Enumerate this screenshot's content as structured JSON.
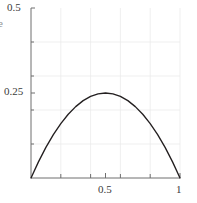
{
  "chart_data": {
    "type": "line",
    "title": "",
    "subtitle": "",
    "xlabel": "",
    "ylabel": "e",
    "xlim": [
      0,
      1
    ],
    "ylim": [
      0,
      0.5
    ],
    "grid": true,
    "legend": null,
    "legend_position": "none",
    "x_ticks": [
      {
        "value": 0.5,
        "label": "0.5"
      },
      {
        "value": 1.0,
        "label": "1"
      }
    ],
    "y_ticks": [
      {
        "value": 0.25,
        "label": "0.25"
      },
      {
        "value": 0.5,
        "label": "0.5"
      }
    ],
    "x_minor_gridlines": [
      0.2,
      0.4,
      0.6,
      0.8
    ],
    "y_minor_gridlines": [
      0.1,
      0.2,
      0.3,
      0.4
    ],
    "series": [
      {
        "name": "y = x(1-x)",
        "color": "#231f20",
        "x": [
          0.0,
          0.05,
          0.1,
          0.15,
          0.2,
          0.25,
          0.3,
          0.35,
          0.4,
          0.45,
          0.5,
          0.55,
          0.6,
          0.65,
          0.7,
          0.75,
          0.8,
          0.85,
          0.9,
          0.95,
          1.0
        ],
        "values": [
          0.0,
          0.0475,
          0.09,
          0.1275,
          0.16,
          0.1875,
          0.21,
          0.2275,
          0.24,
          0.2475,
          0.25,
          0.2475,
          0.24,
          0.2275,
          0.21,
          0.1875,
          0.16,
          0.1275,
          0.09,
          0.0475,
          0.0
        ]
      }
    ],
    "annotations": {
      "peak": {
        "x": 0.5,
        "y": 0.25
      },
      "clipped_y_axis_label": "e",
      "clipped_lower_tick": ""
    },
    "colors": {
      "curve": "#231f20",
      "axis": "#6f6f6f",
      "grid": "#ebebeb",
      "tick_text": "#3a3a3a",
      "background": "#ffffff"
    }
  }
}
